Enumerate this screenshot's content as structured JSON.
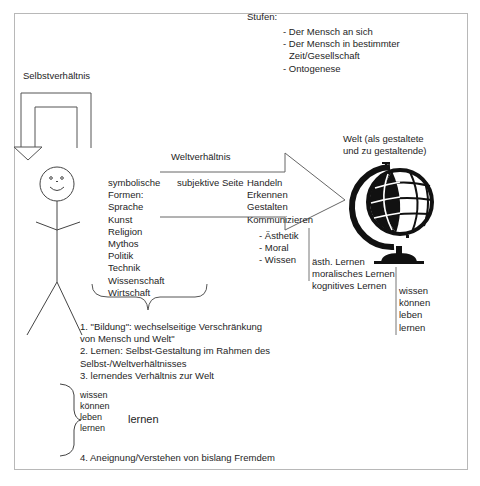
{
  "diagram": {
    "self_relation_label": "Selbstverhältnis",
    "stages": {
      "title": "Stufen:",
      "items": [
        "- Der Mensch an sich",
        "- Der Mensch in bestimmter",
        "  Zeit/Gesellschaft",
        "- Ontogenese"
      ]
    },
    "world_label": {
      "line1": "Welt (als gestaltete",
      "line2": "und zu gestaltende)"
    },
    "world_relation_label": "Weltverhältnis",
    "symbolic_forms": [
      "symbolische",
      "Formen:",
      "Sprache",
      "Kunst",
      "Religion",
      "Mythos",
      "Politik",
      "Technik",
      "Wissenschaft",
      "Wirtschaft"
    ],
    "subjective_side_label": "subjektive Seite",
    "activities": [
      "Handeln",
      "Erkennen",
      "Gestalten",
      "Kommunizieren"
    ],
    "domains": [
      "- Ästhetik",
      "- Moral",
      "- Wissen"
    ],
    "learning_types": [
      "ästh. Lernen",
      "moralisches Lernen",
      "kognitives Lernen"
    ],
    "learning_modes_right": [
      "wissen",
      "können",
      "leben",
      "lernen"
    ],
    "theses": [
      "1. \"Bildung\": wechselseitige Verschränkung",
      "von Mensch und Welt\"",
      "2. Lernen: Selbst-Gestaltung im Rahmen des",
      "Selbst-/Weltverhältnisses",
      "3. lernendes Verhältnis zur Welt"
    ],
    "learning_modes_bracket": [
      "wissen",
      "können",
      "leben",
      "lernen"
    ],
    "bracket_result": "lernen",
    "thesis4": "4. Aneignung/Verstehen von bislang Fremdem",
    "icons": {
      "figure": "stick-figure-icon",
      "globe": "globe-icon"
    }
  }
}
